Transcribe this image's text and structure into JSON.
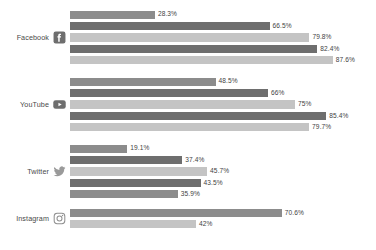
{
  "chart_data": {
    "type": "bar",
    "orientation": "horizontal",
    "title": "",
    "subtitle": "",
    "xlabel": "",
    "ylabel": "",
    "xlim": [
      0,
      100
    ],
    "grid": false,
    "legend": null,
    "value_suffix": "%",
    "note": "Grouped horizontal bar chart; each platform shows up to 5 bars. The Instagram group is clipped by the bottom edge of the image, showing only 2 bars.",
    "categories": [
      "Facebook",
      "YouTube",
      "Twitter",
      "Instagram"
    ],
    "groups": [
      {
        "category": "Facebook",
        "icon": "facebook-icon",
        "bars": [
          {
            "value": 28.3,
            "label": "28.3%",
            "tone": "mid"
          },
          {
            "value": 66.5,
            "label": "66.5%",
            "tone": "dark"
          },
          {
            "value": 79.8,
            "label": "79.8%",
            "tone": "light"
          },
          {
            "value": 82.4,
            "label": "82.4%",
            "tone": "dark"
          },
          {
            "value": 87.6,
            "label": "87.6%",
            "tone": "light"
          }
        ]
      },
      {
        "category": "YouTube",
        "icon": "youtube-icon",
        "bars": [
          {
            "value": 48.5,
            "label": "48.5%",
            "tone": "mid"
          },
          {
            "value": 66,
            "label": "66%",
            "tone": "dark"
          },
          {
            "value": 75,
            "label": "75%",
            "tone": "light"
          },
          {
            "value": 85.4,
            "label": "85.4%",
            "tone": "dark"
          },
          {
            "value": 79.7,
            "label": "79.7%",
            "tone": "light"
          }
        ]
      },
      {
        "category": "Twitter",
        "icon": "twitter-icon",
        "bars": [
          {
            "value": 19.1,
            "label": "19.1%",
            "tone": "mid"
          },
          {
            "value": 37.4,
            "label": "37.4%",
            "tone": "dark"
          },
          {
            "value": 45.7,
            "label": "45.7%",
            "tone": "light"
          },
          {
            "value": 43.5,
            "label": "43.5%",
            "tone": "dark"
          },
          {
            "value": 35.9,
            "label": "35.9%",
            "tone": "mid"
          }
        ]
      },
      {
        "category": "Instagram",
        "icon": "instagram-icon",
        "bars": [
          {
            "value": 70.6,
            "label": "70.6%",
            "tone": "mid"
          },
          {
            "value": 42,
            "label": "42%",
            "tone": "light"
          }
        ]
      }
    ]
  },
  "palette": {
    "tone_mid": "#8c8c8c",
    "tone_dark": "#6e6e6e",
    "tone_light": "#c4c4c4",
    "background": "#ffffff",
    "label_text": "#4a4a4a",
    "value_text": "#3f3f3f"
  },
  "layout": {
    "bar_origin_px": 70,
    "bar_track_px": 300,
    "scale_max": 100
  }
}
